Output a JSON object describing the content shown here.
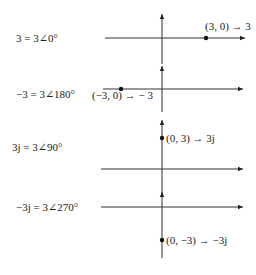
{
  "panels": [
    {
      "equation": "3 = 3∠0°",
      "point_label": "(3, 0) → 3",
      "point": {
        "re": 3,
        "im": 0
      }
    },
    {
      "equation": "−3 = 3∠180°",
      "point_label": "(−3, 0) → − 3",
      "point": {
        "re": -3,
        "im": 0
      }
    },
    {
      "equation": "3j = 3∠90°",
      "point_label": "(0, 3) → 3j",
      "point": {
        "re": 0,
        "im": 3
      }
    },
    {
      "equation": "−3j = 3∠270°",
      "point_label": "(0, −3) → −3j",
      "point": {
        "re": 0,
        "im": -3
      }
    }
  ],
  "colors": {
    "ink": "#222222",
    "background": "#ffffff"
  }
}
